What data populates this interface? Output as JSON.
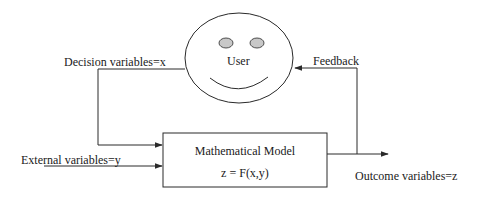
{
  "diagram": {
    "user": {
      "label": "User"
    },
    "model_box": {
      "title": "Mathematical Model",
      "equation": "z = F(x,y)"
    },
    "edges": {
      "decision": "Decision variables=x",
      "external": "External variables=y",
      "outcome": "Outcome variables=z",
      "feedback": "Feedback"
    },
    "colors": {
      "line": "#2a2a2a",
      "eye_fill": "#c8c8c8",
      "background": "#ffffff",
      "bleed_text": "#e6e6e6"
    }
  }
}
